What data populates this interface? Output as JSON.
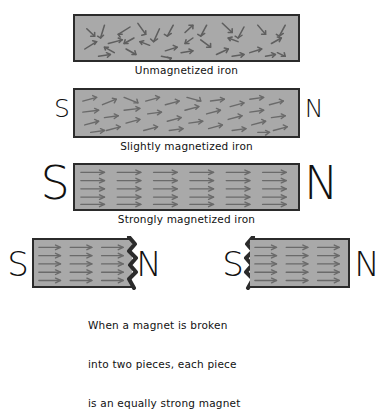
{
  "figure": {
    "background_color": "#ffffff",
    "bar_fill_color": "#a9a9a9",
    "bar_border_color": "#2b2b2b",
    "arrow_color": "#5a5a5a",
    "text_color": "#111111"
  },
  "panels": [
    {
      "id": "unmagnetized",
      "caption": "Unmagnetized iron",
      "south_pole": "",
      "north_pole": "",
      "domain_state": "random",
      "has_poles": false
    },
    {
      "id": "slightly-magnetized",
      "caption": "Slightly magnetized iron",
      "south_pole": "S",
      "north_pole": "N",
      "domain_state": "partially-aligned",
      "has_poles": true
    },
    {
      "id": "strongly-magnetized",
      "caption": "Strongly magnetized iron",
      "south_pole": "S",
      "north_pole": "N",
      "domain_state": "fully-aligned",
      "has_poles": true
    },
    {
      "id": "broken-piece-left",
      "caption": "",
      "south_pole": "S",
      "north_pole": "N",
      "domain_state": "fully-aligned",
      "has_poles": true
    },
    {
      "id": "broken-piece-right",
      "caption": "",
      "south_pole": "S",
      "north_pole": "N",
      "domain_state": "fully-aligned",
      "has_poles": true
    }
  ],
  "bottom_caption": {
    "line1": "When a magnet is broken",
    "line2": "into two pieces, each piece",
    "line3": "is an equally strong magnet"
  }
}
